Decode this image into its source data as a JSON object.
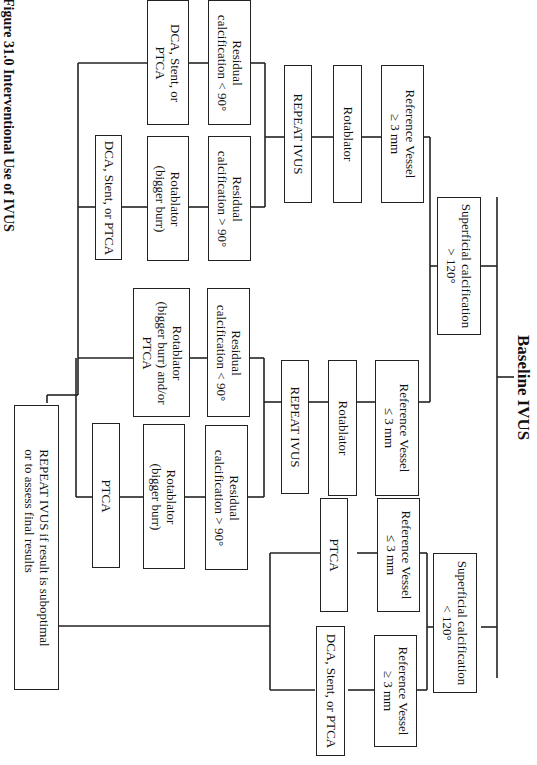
{
  "title": "Baseline IVUS",
  "caption": "Figure 31.0   Interventional Use of IVUS",
  "nodes": {
    "superficial_gt": {
      "line1": "Superficial calcification",
      "line2": "> 120°"
    },
    "superficial_lt": {
      "line1": "Superficial calcification",
      "line2": "< 120°"
    },
    "ref_ge_a": {
      "line1": "Reference Vessel",
      "line2": "≥ 3 mm"
    },
    "ref_le_a": {
      "line1": "Reference Vessel",
      "line2": "≤ 3 mm"
    },
    "ref_le_b": {
      "line1": "Reference Vessel",
      "line2": "≤ 3 mm"
    },
    "ref_ge_b": {
      "line1": "Reference Vessel",
      "line2": "≥ 3 mm"
    },
    "rotablator_a": {
      "line1": "Rotablator"
    },
    "rotablator_b": {
      "line1": "Rotablator"
    },
    "repeat_a": {
      "line1": "REPEAT IVUS"
    },
    "repeat_b": {
      "line1": "REPEAT IVUS"
    },
    "resid_lt_a": {
      "line1": "Residual",
      "line2": "calcification < 90°"
    },
    "resid_gt_a": {
      "line1": "Residual",
      "line2": "calcification > 90°"
    },
    "resid_lt_b": {
      "line1": "Residual",
      "line2": "calcification < 90°"
    },
    "resid_gt_b": {
      "line1": "Residual",
      "line2": "calcification > 90°"
    },
    "dca_a": {
      "line1": "DCA, Stent, or",
      "line2": "PTCA"
    },
    "rota_big_a": {
      "line1": "Rotablator",
      "line2": "(bigger burr)"
    },
    "dca_b": {
      "line1": "DCA, Stent, or PTCA"
    },
    "rota_big_or": {
      "line1": "Rotablator",
      "line2": "(bigger burr) and/or",
      "line3": "PTCA"
    },
    "rota_big_b": {
      "line1": "Rotablator",
      "line2": "(bigger burr)"
    },
    "ptca_b": {
      "line1": "PTCA"
    },
    "ptca_c": {
      "line1": "PTCA"
    },
    "dca_c": {
      "line1": "DCA, Stent, or PTCA"
    },
    "final": {
      "line1": "REPEAT IVUS if result is suboptimal",
      "line2": "or to assess final results"
    }
  },
  "colors": {
    "line": "#222222",
    "background": "#ffffff"
  }
}
